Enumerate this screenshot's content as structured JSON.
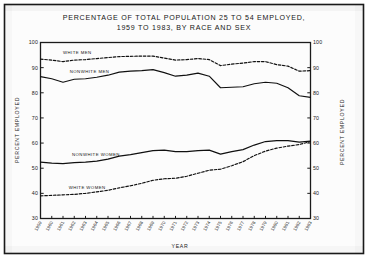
{
  "figure": {
    "title_line1": "PERCENTAGE OF TOTAL POPULATION 25 TO 54 EMPLOYED,",
    "title_line2": "1959 TO 1983, BY RACE AND SEX"
  },
  "chart_data": {
    "type": "line",
    "title": "PERCENTAGE OF TOTAL POPULATION 25 TO 54 EMPLOYED, 1959 TO 1983, BY RACE AND SEX",
    "xlabel": "YEAR",
    "ylabel": "PERCENT EMPLOYED",
    "ylabel_right": "PERCENT EMPLOYED",
    "grid": false,
    "legend_position": "inline-on-curves",
    "ylim": [
      30,
      100
    ],
    "yticks": [
      30,
      40,
      50,
      60,
      70,
      80,
      90,
      100
    ],
    "yticks_right": [
      30,
      40,
      50,
      60,
      70,
      80,
      90,
      100
    ],
    "xlim": [
      1959,
      1983
    ],
    "x": [
      1959,
      1960,
      1961,
      1962,
      1963,
      1964,
      1965,
      1966,
      1967,
      1968,
      1969,
      1970,
      1971,
      1972,
      1973,
      1974,
      1975,
      1976,
      1977,
      1978,
      1979,
      1980,
      1981,
      1982,
      1983
    ],
    "xticklabels": [
      "1959",
      "1960",
      "1961",
      "1962",
      "1963",
      "1964",
      "1965",
      "1966",
      "1967",
      "1968",
      "1969",
      "1970",
      "1971",
      "1972",
      "1973",
      "1974",
      "1975",
      "1976",
      "1977",
      "1978",
      "1979",
      "1980",
      "1981",
      "1982",
      "1983"
    ],
    "series": [
      {
        "name": "WHITE MEN",
        "style": "dashed",
        "label_x": 1961.0,
        "label_y": 95.5,
        "values": [
          93.4,
          93.0,
          92.4,
          93.0,
          93.2,
          93.6,
          94.0,
          94.4,
          94.5,
          94.6,
          94.6,
          93.8,
          93.0,
          93.2,
          93.6,
          93.2,
          90.8,
          91.4,
          91.8,
          92.4,
          92.4,
          91.2,
          90.6,
          88.6,
          88.8
        ]
      },
      {
        "name": "NONWHITE MEN",
        "style": "solid",
        "label_x": 1961.6,
        "label_y": 88.0,
        "values": [
          86.4,
          85.6,
          84.2,
          85.4,
          85.6,
          86.2,
          87.0,
          88.2,
          88.6,
          88.8,
          89.2,
          88.0,
          86.6,
          87.0,
          87.8,
          86.6,
          82.0,
          82.2,
          82.4,
          83.6,
          84.2,
          83.8,
          82.0,
          78.8,
          78.2
        ]
      },
      {
        "name": "NONWHITE WOMEN",
        "style": "solid",
        "label_x": 1961.8,
        "label_y": 54.8,
        "values": [
          52.4,
          52.0,
          51.8,
          52.2,
          52.4,
          52.8,
          53.6,
          54.8,
          55.4,
          56.2,
          57.0,
          57.2,
          56.6,
          56.6,
          57.0,
          57.2,
          55.6,
          56.6,
          57.4,
          59.2,
          60.6,
          61.0,
          61.0,
          60.4,
          60.8
        ]
      },
      {
        "name": "WHITE WOMEN",
        "style": "dashed",
        "label_x": 1961.5,
        "label_y": 41.6,
        "values": [
          39.0,
          39.2,
          39.4,
          39.6,
          40.0,
          40.6,
          41.2,
          42.2,
          43.0,
          44.0,
          45.2,
          45.8,
          46.0,
          46.8,
          48.0,
          49.2,
          49.6,
          51.0,
          52.6,
          55.0,
          56.8,
          58.0,
          58.8,
          59.4,
          60.6
        ]
      }
    ]
  }
}
